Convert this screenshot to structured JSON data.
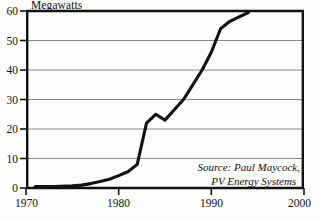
{
  "chart_data": {
    "type": "line",
    "title": "Megawatts",
    "xlabel": "",
    "ylabel": "Megawatts",
    "xlim": [
      1970,
      2000
    ],
    "ylim": [
      0,
      60
    ],
    "grid": true,
    "legend": false,
    "y_ticks": [
      0,
      10,
      20,
      30,
      40,
      50,
      60
    ],
    "x_ticks": [
      1970,
      1980,
      1990,
      2000
    ],
    "annotations": [
      "Source: Paul Maycock,",
      "PV Energy Systems"
    ],
    "series": [
      {
        "name": "World photovoltaic shipments",
        "x": [
          1971,
          1973,
          1975,
          1976,
          1977,
          1978,
          1979,
          1980,
          1981,
          1982,
          1983,
          1984,
          1985,
          1986,
          1987,
          1988,
          1989,
          1990,
          1991,
          1992,
          1993,
          1994
        ],
        "values": [
          0.5,
          0.5,
          0.7,
          1.0,
          1.5,
          2.2,
          3.0,
          4.2,
          5.5,
          8.0,
          22.0,
          25.0,
          23.0,
          26.5,
          30.0,
          35.0,
          40.0,
          46.0,
          54.0,
          56.5,
          58.0,
          59.5
        ]
      }
    ]
  },
  "labels": {
    "y": [
      "60",
      "50",
      "40",
      "30",
      "20",
      "10",
      "0"
    ],
    "x": [
      "1970",
      "1980",
      "1990",
      "2000"
    ]
  },
  "source": {
    "line1": "Source: Paul Maycock,",
    "line2": "PV Energy Systems"
  },
  "colors": {
    "ink": "#121212",
    "grid": "#8a8a8a",
    "frame": "#121212",
    "background": "#fdfdfb"
  }
}
